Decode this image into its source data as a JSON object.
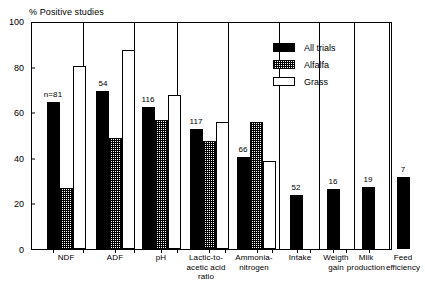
{
  "chart_data": {
    "type": "bar",
    "title": "% Positive studies",
    "xlabel": "",
    "ylabel": "% Positive studies",
    "ylim": [
      0,
      100
    ],
    "yticks": [
      0,
      20,
      40,
      60,
      80,
      100
    ],
    "ytick_labels": [
      "0",
      "20",
      "40",
      "60",
      "80",
      "100"
    ],
    "grid": false,
    "legend_position": "top-right",
    "categories": [
      "NDF",
      "ADF",
      "pH",
      "Lactic-to-acetic acid ratio",
      "Ammonia-nitrogen",
      "Intake",
      "Weigth gain",
      "Milk production",
      "Feed efficiency"
    ],
    "category_label_lines": [
      [
        "NDF"
      ],
      [
        "ADF"
      ],
      [
        "pH"
      ],
      [
        "Lactic-to-",
        "acetic acid",
        "ratio"
      ],
      [
        "Ammonia-",
        "nitrogen"
      ],
      [
        "Intake"
      ],
      [
        "Weigth",
        "gain"
      ],
      [
        "Milk",
        "production"
      ],
      [
        "Feed",
        "efficiency"
      ]
    ],
    "series": [
      {
        "name": "All trials",
        "fill": "solid-black",
        "color": "#000000",
        "values": [
          65,
          70,
          63,
          53,
          40.5,
          24,
          26.5,
          27.5,
          32
        ]
      },
      {
        "name": "Alfalfa",
        "fill": "checkered-hatch",
        "color": "#808080",
        "values": [
          27,
          49,
          57,
          48,
          56,
          null,
          null,
          null,
          null
        ]
      },
      {
        "name": "Grass",
        "fill": "white-outline",
        "color": "#ffffff",
        "values": [
          81,
          88,
          68,
          56,
          39,
          null,
          null,
          null,
          null
        ]
      }
    ],
    "annotations": [
      {
        "category": "NDF",
        "text": "n=81"
      },
      {
        "category": "ADF",
        "text": "54"
      },
      {
        "category": "pH",
        "text": "116"
      },
      {
        "category": "Lactic-to-acetic acid ratio",
        "text": "117"
      },
      {
        "category": "Ammonia-nitrogen",
        "text": "66"
      },
      {
        "category": "Intake",
        "text": "52"
      },
      {
        "category": "Weigth gain",
        "text": "16"
      },
      {
        "category": "Milk production",
        "text": "19"
      },
      {
        "category": "Feed efficiency",
        "text": "7"
      }
    ]
  },
  "legend": {
    "entries": [
      {
        "label": "All trials"
      },
      {
        "label": "Alfalfa"
      },
      {
        "label": "Grass"
      }
    ]
  }
}
